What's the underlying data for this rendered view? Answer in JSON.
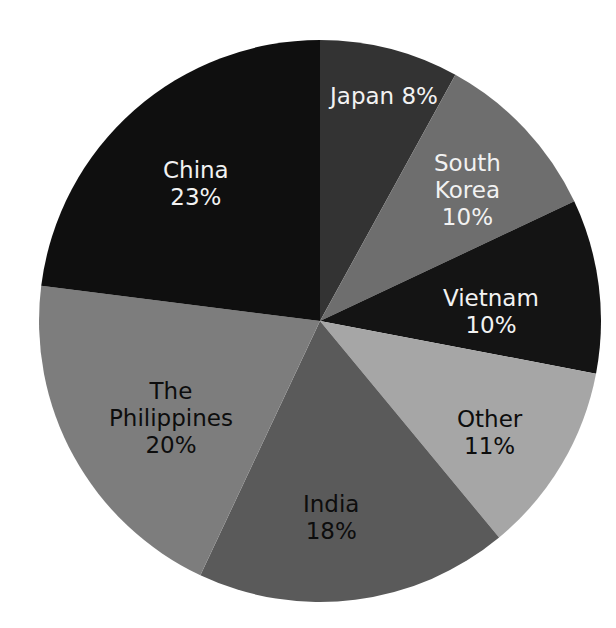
{
  "chart_data": {
    "type": "pie",
    "title": "",
    "subtitle": "",
    "xlabel": "",
    "ylabel": "",
    "grid": false,
    "legend_position": "none",
    "labels_inside_slices": true,
    "start_angle_deg": 0,
    "direction": "clockwise",
    "categories": [
      "Japan",
      "South Korea",
      "Vietnam",
      "Other",
      "India",
      "The Philippines",
      "China"
    ],
    "values": [
      8,
      10,
      10,
      11,
      18,
      20,
      23
    ],
    "unit": "%",
    "slices": [
      {
        "name": "Japan",
        "value": 8,
        "value_text": "8%",
        "label_text": "Japan 8%",
        "label_lines": [
          "Japan 8%"
        ],
        "color": "#333333",
        "text_color": "#f2f2f2",
        "label_x": 384,
        "label_y": 96
      },
      {
        "name": "South Korea",
        "value": 10,
        "value_text": "10%",
        "label_text": "South Korea 10%",
        "label_lines": [
          "South",
          "Korea",
          "10%"
        ],
        "color": "#6e6e6e",
        "text_color": "#f2f2f2",
        "label_x": 467,
        "label_y": 190
      },
      {
        "name": "Vietnam",
        "value": 10,
        "value_text": "10%",
        "label_text": "Vietnam 10%",
        "label_lines": [
          "Vietnam",
          "10%"
        ],
        "color": "#141414",
        "text_color": "#f2f2f2",
        "label_x": 491,
        "label_y": 312
      },
      {
        "name": "Other",
        "value": 11,
        "value_text": "11%",
        "label_text": "Other 11%",
        "label_lines": [
          "Other",
          "11%"
        ],
        "color": "#a6a6a6",
        "text_color": "#0d0d0d",
        "label_x": 489,
        "label_y": 433
      },
      {
        "name": "India",
        "value": 18,
        "value_text": "18%",
        "label_text": "India 18%",
        "label_lines": [
          "India",
          "18%"
        ],
        "color": "#5a5a5a",
        "text_color": "#0d0d0d",
        "label_x": 331,
        "label_y": 518
      },
      {
        "name": "The Philippines",
        "value": 20,
        "value_text": "20%",
        "label_text": "The Philippines 20%",
        "label_lines": [
          "The",
          "Philippines",
          "20%"
        ],
        "color": "#7d7d7d",
        "text_color": "#0d0d0d",
        "label_x": 171,
        "label_y": 418
      },
      {
        "name": "China",
        "value": 23,
        "value_text": "23%",
        "label_text": "China 23%",
        "label_lines": [
          "China",
          "23%"
        ],
        "color": "#0f0f0f",
        "text_color": "#f2f2f2",
        "label_x": 196,
        "label_y": 184
      }
    ],
    "geometry": {
      "center_x": 320,
      "center_y": 321,
      "radius": 281,
      "background": "#ffffff"
    }
  }
}
